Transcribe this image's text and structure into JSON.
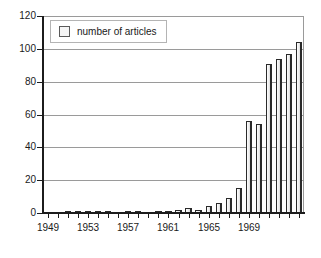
{
  "chart_data": {
    "type": "bar",
    "title": "",
    "subtitle": "",
    "xlabel": "",
    "ylabel": "",
    "grid": true,
    "legend_position": "top-left",
    "ylim": [
      0,
      120
    ],
    "y_ticks": [
      0,
      20,
      40,
      60,
      80,
      100,
      120
    ],
    "y_tick_labels": [
      "0",
      "20",
      "40",
      "60",
      "80",
      "100",
      "120"
    ],
    "x_tick_labels": [
      "1949",
      "1953",
      "1957",
      "1961",
      "1965",
      "1969"
    ],
    "x_tick_label_step": 4,
    "categories": [
      "1949",
      "1950",
      "1951",
      "1952",
      "1953",
      "1954",
      "1955",
      "1956",
      "1957",
      "1958",
      "1959",
      "1960",
      "1961",
      "1962",
      "1963",
      "1964",
      "1965",
      "1966",
      "1967",
      "1968",
      "1969",
      "1970",
      "1971",
      "1972"
    ],
    "series": [
      {
        "name": "number of articles",
        "values": [
          0,
          0,
          1,
          1,
          1,
          1,
          1,
          0,
          1,
          1,
          0,
          1,
          1,
          2,
          3,
          2,
          4,
          6,
          9,
          15,
          56,
          54,
          91,
          94
        ]
      }
    ],
    "values": [
      0,
      0,
      1,
      1,
      1,
      1,
      1,
      0,
      1,
      1,
      0,
      1,
      1,
      2,
      3,
      2,
      4,
      6,
      9,
      15,
      56,
      54,
      91,
      94
    ],
    "extra_values": [
      97,
      104
    ],
    "legend": [
      {
        "label": "number of articles",
        "swatch_color": "#f5f5f5"
      }
    ],
    "colors": {
      "bar_fill": "#f2f2f2",
      "bar_edge": "#2a2a2a",
      "gridline": "#9a9a9a",
      "axis": "#1c1c1c",
      "text": "#1a1a1a",
      "background": "#ffffff"
    }
  },
  "legend": {
    "label": "number of articles"
  },
  "axes": {
    "y": {
      "labels": [
        "120",
        "100",
        "80",
        "60",
        "40",
        "20",
        "0"
      ]
    },
    "x": {
      "labels": [
        "1949",
        "1953",
        "1957",
        "1961",
        "1965",
        "1969"
      ]
    }
  }
}
